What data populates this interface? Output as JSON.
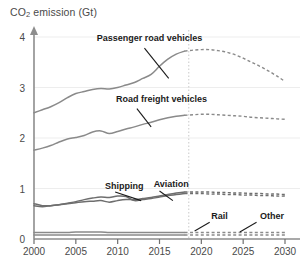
{
  "chart_data": {
    "type": "line",
    "title": "CO2 emission (Gt)",
    "title_main": "CO",
    "title_sub": "2",
    "title_rest": " emission (Gt)",
    "xlabel": "",
    "ylabel": "CO2 emission (Gt)",
    "xlim": [
      2000,
      2031
    ],
    "ylim": [
      0,
      4.15
    ],
    "xticks": [
      2000,
      2005,
      2010,
      2015,
      2020,
      2025,
      2030
    ],
    "xtick_labels": [
      "2000",
      "2005",
      "2010",
      "2015",
      "2020",
      "2025",
      "2030"
    ],
    "yticks": [
      0,
      1,
      2,
      3,
      4
    ],
    "ytick_labels": [
      "0",
      "1",
      "2",
      "3",
      "4"
    ],
    "grid": true,
    "legend_position": "inline-annotations",
    "forecast_divider_x": 2018.5,
    "colors": {
      "line": "#8a8a8a",
      "line_dark": "#6e6e6e",
      "label_text": "#1b1b1b",
      "axis": "#8d8d8d",
      "grid": "#ededed",
      "divider": "#c9c9c9"
    },
    "x": [
      2000,
      2001,
      2002,
      2003,
      2004,
      2005,
      2006,
      2007,
      2008,
      2009,
      2010,
      2011,
      2012,
      2013,
      2014,
      2015,
      2016,
      2017,
      2018,
      2019,
      2020,
      2021,
      2022,
      2023,
      2024,
      2025,
      2026,
      2027,
      2028,
      2029,
      2030
    ],
    "history_end_index": 18,
    "series": [
      {
        "name": "Passenger road vehicles",
        "label": "Passenger road vehicles",
        "label_x": 2007.5,
        "label_y": 3.92,
        "leader": [
          [
            2013.2,
            3.78
          ],
          [
            2016.1,
            3.18
          ]
        ],
        "values": [
          2.5,
          2.56,
          2.62,
          2.7,
          2.8,
          2.88,
          2.92,
          2.96,
          2.98,
          2.97,
          3.0,
          3.05,
          3.1,
          3.18,
          3.26,
          3.42,
          3.56,
          3.66,
          3.72,
          3.74,
          3.75,
          3.75,
          3.73,
          3.7,
          3.65,
          3.58,
          3.5,
          3.42,
          3.33,
          3.23,
          3.12
        ]
      },
      {
        "name": "Road freight vehicles",
        "label": "Road freight vehicles",
        "label_x": 2009.8,
        "label_y": 2.72,
        "leader": [
          [
            2012.3,
            2.58
          ],
          [
            2014.0,
            2.22
          ]
        ],
        "values": [
          1.76,
          1.8,
          1.85,
          1.92,
          1.98,
          2.01,
          2.05,
          2.12,
          2.14,
          2.09,
          2.13,
          2.18,
          2.22,
          2.27,
          2.31,
          2.36,
          2.4,
          2.43,
          2.45,
          2.46,
          2.47,
          2.47,
          2.46,
          2.45,
          2.44,
          2.43,
          2.41,
          2.4,
          2.39,
          2.38,
          2.37
        ]
      },
      {
        "name": "Shipping",
        "label": "Shipping",
        "label_x": 2008.5,
        "label_y": 1.0,
        "leader": [
          [
            2009.7,
            0.93
          ],
          [
            2012.8,
            0.76
          ]
        ],
        "values": [
          0.66,
          0.64,
          0.66,
          0.68,
          0.71,
          0.74,
          0.78,
          0.81,
          0.83,
          0.82,
          0.85,
          0.84,
          0.76,
          0.78,
          0.8,
          0.83,
          0.86,
          0.88,
          0.9,
          0.9,
          0.9,
          0.89,
          0.89,
          0.88,
          0.88,
          0.87,
          0.87,
          0.86,
          0.86,
          0.85,
          0.85
        ]
      },
      {
        "name": "Aviation",
        "label": "Aviation",
        "label_x": 2014.3,
        "label_y": 1.02,
        "leader": [
          [
            2015.0,
            0.95
          ],
          [
            2016.6,
            0.76
          ]
        ],
        "values": [
          0.7,
          0.66,
          0.66,
          0.68,
          0.7,
          0.72,
          0.74,
          0.75,
          0.76,
          0.73,
          0.76,
          0.78,
          0.78,
          0.8,
          0.82,
          0.85,
          0.88,
          0.91,
          0.93,
          0.93,
          0.93,
          0.93,
          0.92,
          0.92,
          0.91,
          0.91,
          0.9,
          0.9,
          0.89,
          0.89,
          0.88
        ]
      },
      {
        "name": "Rail",
        "label": "Rail",
        "label_x": 2021.2,
        "label_y": 0.4,
        "leader": [
          [
            2021.0,
            0.33
          ],
          [
            2019.2,
            0.16
          ]
        ],
        "values": [
          0.13,
          0.13,
          0.13,
          0.13,
          0.13,
          0.14,
          0.14,
          0.14,
          0.14,
          0.13,
          0.13,
          0.13,
          0.13,
          0.13,
          0.13,
          0.13,
          0.13,
          0.13,
          0.13,
          0.13,
          0.13,
          0.13,
          0.13,
          0.13,
          0.13,
          0.13,
          0.13,
          0.13,
          0.13,
          0.13,
          0.13
        ]
      },
      {
        "name": "Other",
        "label": "Other",
        "label_x": 2027.0,
        "label_y": 0.39,
        "leader": [
          [
            2026.6,
            0.33
          ],
          [
            2024.6,
            0.14
          ]
        ],
        "values": [
          0.08,
          0.08,
          0.08,
          0.08,
          0.08,
          0.08,
          0.08,
          0.08,
          0.08,
          0.08,
          0.08,
          0.08,
          0.08,
          0.08,
          0.08,
          0.08,
          0.08,
          0.08,
          0.08,
          0.08,
          0.08,
          0.08,
          0.08,
          0.08,
          0.08,
          0.08,
          0.08,
          0.08,
          0.08,
          0.08,
          0.08
        ]
      }
    ]
  }
}
